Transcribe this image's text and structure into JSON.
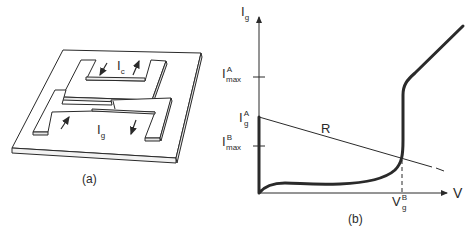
{
  "figure_a": {
    "caption": "(a)",
    "labels": {
      "control_current": "I",
      "control_current_sub": "c",
      "gate_current": "I",
      "gate_current_sub": "g"
    }
  },
  "figure_b": {
    "caption": "(b)",
    "y_axis": {
      "label": "I",
      "label_sub": "g"
    },
    "x_axis": {
      "label": "V"
    },
    "ticks": {
      "imax_a": {
        "main": "I",
        "sup": "A",
        "sub": "max"
      },
      "ig_a": {
        "main": "I",
        "sup": "A",
        "sub": "g"
      },
      "imax_b": {
        "main": "I",
        "sup": "B",
        "sub": "max"
      },
      "vg_b": {
        "main": "V",
        "sup": "B",
        "sub": "g"
      }
    },
    "load_line_label": "R"
  },
  "colors": {
    "ink": "#2a2a2a",
    "background": "#ffffff"
  }
}
